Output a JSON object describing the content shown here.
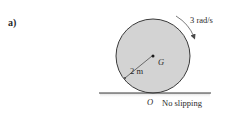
{
  "figure": {
    "part_label": "a)",
    "angular_velocity_label": "3 rad/s",
    "center_label": "G",
    "radius_label": "2 m",
    "contact_point_label": "O",
    "condition_label": "No slipping"
  },
  "colors": {
    "disk_fill": "#d3d3d3",
    "disk_stroke": "#3a3a3a",
    "ground": "#3a3a3a",
    "text": "#2a2a2a"
  }
}
